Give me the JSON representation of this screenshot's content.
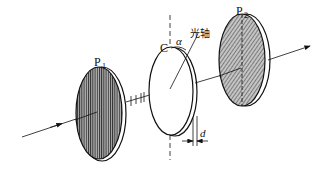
{
  "diagram": {
    "title": "",
    "labels": {
      "polarizer_1": "P",
      "polarizer_1_sub": "1",
      "polarizer_2": "P",
      "polarizer_2_sub": "2",
      "crystal": "C",
      "angle": "α",
      "optic_axis": "光轴",
      "thickness": "d"
    },
    "components": [
      {
        "id": "P1",
        "type": "polarizer",
        "hatch": "vertical"
      },
      {
        "id": "C",
        "type": "wave-plate",
        "property": "optic axis at angle α to vertical, thickness d"
      },
      {
        "id": "P2",
        "type": "analyzer",
        "hatch": "diagonal",
        "axis": "vertical dashed line"
      }
    ],
    "colors": {
      "stroke": "#111111",
      "fill_dark": "#8a8a8a",
      "background": "#ffffff"
    }
  }
}
